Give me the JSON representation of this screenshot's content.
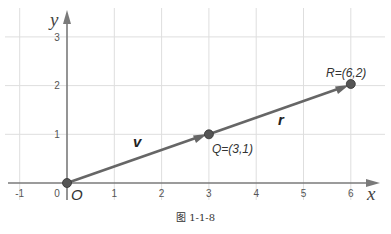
{
  "figure": {
    "caption": "图 1-1-8",
    "x_axis_label": "x",
    "y_axis_label": "y",
    "origin_label": "O",
    "x_ticks": [
      "-1",
      "0",
      "1",
      "2",
      "3",
      "4",
      "5",
      "6"
    ],
    "y_ticks": [
      "1",
      "2",
      "3"
    ],
    "points": [
      {
        "name": "O",
        "label": "O",
        "x": 0,
        "y": 0
      },
      {
        "name": "Q",
        "label": "Q=(3,1)",
        "x": 3,
        "y": 1
      },
      {
        "name": "R",
        "label": "R=(6,2)",
        "x": 6,
        "y": 2
      }
    ],
    "vectors": [
      {
        "label": "v",
        "from": "O",
        "to": "Q"
      },
      {
        "label": "r",
        "from": "Q",
        "to": "R"
      }
    ],
    "colors": {
      "grid": "#dddddd",
      "axis": "#777777",
      "vector": "#666666",
      "point": "#555555"
    }
  }
}
